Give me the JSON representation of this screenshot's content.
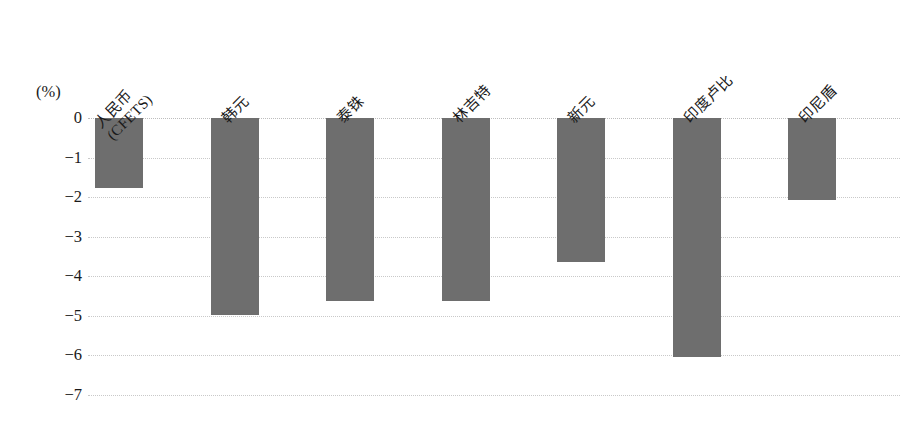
{
  "chart_data": {
    "type": "bar",
    "title": "",
    "subtitle": "",
    "xlabel": "",
    "ylabel": "",
    "unit_label": "(%)",
    "orientation": "vertical",
    "grid": true,
    "grid_style": "dotted-horizontal",
    "legend": "none",
    "bar_color": "#6e6e6e",
    "background_color": "#ffffff",
    "gridline_color": "#c9c9c9",
    "ylim": [
      -7,
      0
    ],
    "ytick_values": [
      0,
      -1,
      -2,
      -3,
      -4,
      -5,
      -6,
      -7
    ],
    "ytick_labels": [
      "0",
      "−1",
      "−2",
      "−3",
      "−4",
      "−5",
      "−6",
      "−7"
    ],
    "categories": [
      "人民币\n(CFETS)",
      "韩元",
      "泰铢",
      "林吉特",
      "新元",
      "印度卢比",
      "印尼盾"
    ],
    "category_labels_rotation_deg": -45,
    "values": [
      -1.78,
      -4.97,
      -4.62,
      -4.62,
      -3.65,
      -6.05,
      -2.08
    ],
    "bars": [
      {
        "category": "人民币\n(CFETS)",
        "value": -1.78
      },
      {
        "category": "韩元",
        "value": -4.97
      },
      {
        "category": "泰铢",
        "value": -4.62
      },
      {
        "category": "林吉特",
        "value": -4.62
      },
      {
        "category": "新元",
        "value": -3.65
      },
      {
        "category": "印度卢比",
        "value": -6.05
      },
      {
        "category": "印尼盾",
        "value": -2.08
      }
    ]
  }
}
